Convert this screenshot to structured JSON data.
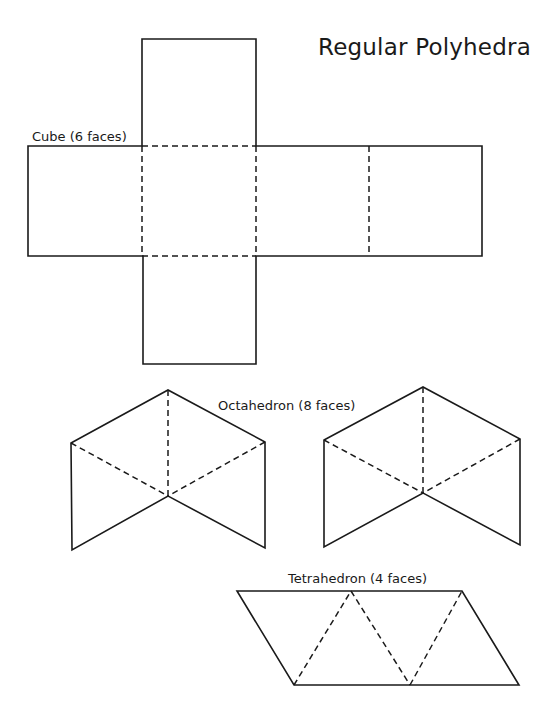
{
  "title": "Regular Polyhedra",
  "labels": {
    "cube": "Cube (6 faces)",
    "octahedron": "Octahedron (8 faces)",
    "tetrahedron": "Tetrahedron (4 faces)"
  },
  "colors": {
    "line": "#1a1a1a",
    "background": "#ffffff"
  },
  "nets": {
    "cube": {
      "faces": 6,
      "solid_outline": [
        [
          142,
          39
        ],
        [
          256,
          39
        ],
        [
          256,
          146
        ],
        [
          482,
          146
        ],
        [
          482,
          256
        ],
        [
          256,
          256
        ],
        [
          256,
          364
        ],
        [
          143,
          364
        ],
        [
          143,
          256
        ],
        [
          28,
          256
        ],
        [
          28,
          146
        ],
        [
          142,
          146
        ]
      ],
      "fold_lines": [
        [
          [
            142,
            146
          ],
          [
            256,
            146
          ]
        ],
        [
          [
            142,
            256
          ],
          [
            256,
            256
          ]
        ],
        [
          [
            142,
            146
          ],
          [
            142,
            256
          ]
        ],
        [
          [
            256,
            146
          ],
          [
            256,
            256
          ]
        ],
        [
          [
            369,
            146
          ],
          [
            369,
            256
          ]
        ]
      ]
    },
    "octahedron_left": {
      "solid_edges": [
        [
          [
            71,
            443
          ],
          [
            168,
            390
          ]
        ],
        [
          [
            168,
            390
          ],
          [
            265,
            442
          ]
        ],
        [
          [
            71,
            443
          ],
          [
            72,
            550
          ]
        ],
        [
          [
            72,
            550
          ],
          [
            168,
            496
          ]
        ],
        [
          [
            168,
            496
          ],
          [
            265,
            548
          ]
        ],
        [
          [
            265,
            548
          ],
          [
            265,
            442
          ]
        ]
      ],
      "fold_lines": [
        [
          [
            168,
            390
          ],
          [
            168,
            496
          ]
        ],
        [
          [
            71,
            443
          ],
          [
            168,
            496
          ]
        ],
        [
          [
            265,
            442
          ],
          [
            168,
            496
          ]
        ]
      ]
    },
    "octahedron_right": {
      "solid_edges": [
        [
          [
            324,
            440
          ],
          [
            423,
            387
          ]
        ],
        [
          [
            423,
            387
          ],
          [
            520,
            439
          ]
        ],
        [
          [
            324,
            440
          ],
          [
            324,
            547
          ]
        ],
        [
          [
            324,
            547
          ],
          [
            423,
            493
          ]
        ],
        [
          [
            423,
            493
          ],
          [
            520,
            545
          ]
        ],
        [
          [
            520,
            545
          ],
          [
            520,
            439
          ]
        ]
      ],
      "fold_lines": [
        [
          [
            423,
            387
          ],
          [
            423,
            493
          ]
        ],
        [
          [
            324,
            440
          ],
          [
            423,
            493
          ]
        ],
        [
          [
            520,
            439
          ],
          [
            423,
            493
          ]
        ]
      ]
    },
    "tetrahedron": {
      "faces": 4,
      "solid_outline": [
        [
          237,
          591
        ],
        [
          462,
          591
        ],
        [
          519,
          685
        ],
        [
          294,
          685
        ]
      ],
      "fold_lines": [
        [
          [
            294,
            685
          ],
          [
            351,
            591
          ]
        ],
        [
          [
            351,
            591
          ],
          [
            410,
            685
          ]
        ],
        [
          [
            410,
            685
          ],
          [
            462,
            591
          ]
        ]
      ]
    }
  }
}
